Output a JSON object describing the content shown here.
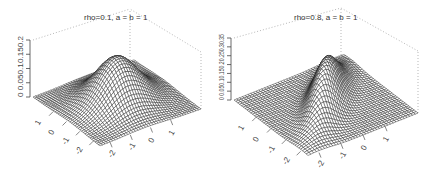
{
  "chart_data": [
    {
      "type": "surface3d",
      "title": "rho=0.1, a = b = 1",
      "rho": 0.1,
      "a": 1,
      "b": 1,
      "x_ticks": [
        "-2",
        "-1",
        "0",
        "1"
      ],
      "y_ticks": [
        "-2",
        "-1",
        "0",
        "1"
      ],
      "z_ticks": [
        "0",
        "0.05",
        "0.1",
        "0.15",
        "0.2"
      ],
      "z_tick_label": "0 0.050.10.150.2",
      "xlim": [
        -2.5,
        2.5
      ],
      "ylim": [
        -2.5,
        2.5
      ],
      "zlim": [
        0,
        0.2
      ],
      "peak_z": 0.16,
      "grid_on": false,
      "box": "dotted back edges"
    },
    {
      "type": "surface3d",
      "title": "rho=0.8, a = b = 1",
      "rho": 0.8,
      "a": 1,
      "b": 1,
      "x_ticks": [
        "-2",
        "-1",
        "0",
        "1"
      ],
      "y_ticks": [
        "-2",
        "-1",
        "0",
        "1"
      ],
      "z_ticks": [
        "0",
        "0.05",
        "0.1",
        "0.15",
        "0.2",
        "0.25",
        "0.3",
        "0.35"
      ],
      "z_tick_label": "0 0.050.10.150.20.250.30.35",
      "xlim": [
        -2.5,
        2.5
      ],
      "ylim": [
        -2.5,
        2.5
      ],
      "zlim": [
        0,
        0.35
      ],
      "peak_z": 0.265,
      "grid_on": false,
      "box": "dotted back edges"
    }
  ],
  "panels": [
    {
      "title": "rho=0.1, a = b = 1",
      "z_axis_label": "0 0.050.10.150.2",
      "front_ticks_left": [
        "1",
        "0",
        "-1",
        "-2"
      ],
      "front_ticks_right": [
        "-2",
        "-1",
        "0",
        "1"
      ]
    },
    {
      "title": "rho=0.8, a = b = 1",
      "z_axis_label": "0 0.050.10.150.20.250.30.35",
      "front_ticks_left": [
        "1",
        "0",
        "-1",
        "-2"
      ],
      "front_ticks_right": [
        "-2",
        "-1",
        "0",
        "1"
      ]
    }
  ]
}
